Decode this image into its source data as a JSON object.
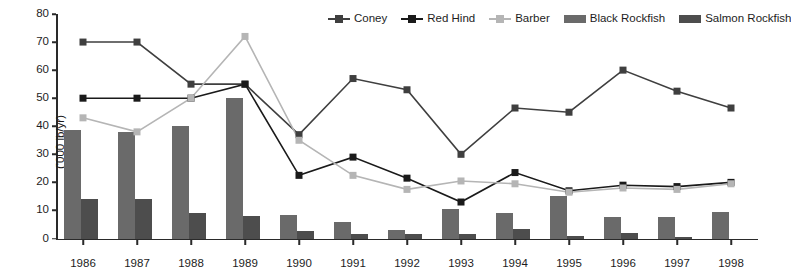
{
  "chart_data": {
    "type": "bar",
    "title": "",
    "xlabel": "",
    "ylabel": "('000 lb/yr)",
    "ylim": [
      0,
      80
    ],
    "yticks": [
      0,
      10,
      20,
      30,
      40,
      50,
      60,
      70,
      80
    ],
    "grid": false,
    "legend_position": "top-right",
    "categories": [
      "1986",
      "1987",
      "1988",
      "1989",
      "1990",
      "1991",
      "1992",
      "1993",
      "1994",
      "1995",
      "1996",
      "1997",
      "1998"
    ],
    "series": [
      {
        "name": "Coney",
        "kind": "line",
        "color": "#3f3f3f",
        "marker": "square",
        "values": [
          70,
          70,
          55,
          55,
          37,
          57,
          53,
          30,
          46.5,
          45,
          60,
          52.5,
          46.5
        ]
      },
      {
        "name": "Red Hind",
        "kind": "line",
        "color": "#1a1a1a",
        "marker": "square",
        "values": [
          50,
          50,
          50,
          55,
          22.5,
          29,
          21.5,
          13,
          23.5,
          17,
          19,
          18.5,
          20
        ]
      },
      {
        "name": "Barber",
        "kind": "line",
        "color": "#b5b5b5",
        "marker": "square",
        "values": [
          43,
          38,
          50,
          72,
          35,
          22.5,
          17.5,
          20.5,
          19.5,
          16.5,
          18,
          17.5,
          19.5
        ]
      },
      {
        "name": "Black Rockfish",
        "kind": "bar",
        "color": "#6a6a6a",
        "values": [
          38.5,
          38,
          40,
          50,
          8.5,
          6,
          3,
          10.5,
          9,
          15,
          7.5,
          7.5,
          9.5
        ]
      },
      {
        "name": "Salmon Rockfish",
        "kind": "bar",
        "color": "#4d4d4d",
        "values": [
          14,
          14,
          9,
          8,
          2.5,
          1.5,
          1.5,
          1.5,
          3.5,
          1,
          2,
          0.5,
          0
        ]
      }
    ]
  }
}
